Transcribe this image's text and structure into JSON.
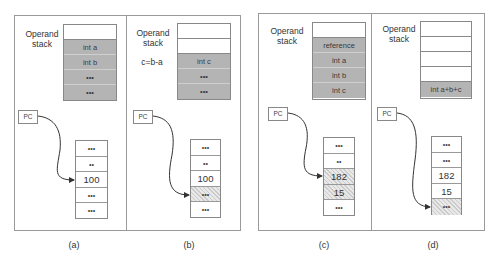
{
  "panels": [
    {
      "caption": "(a)",
      "stack_label": "Operand\nstack",
      "stack_label_line1": "Operand",
      "stack_label_line2": "stack",
      "note": "",
      "stack": [
        {
          "text": "",
          "state": "empty"
        },
        {
          "text": "int a",
          "state": "filled"
        },
        {
          "text": "int b",
          "state": "filled"
        },
        {
          "text": "•••",
          "state": "filled"
        },
        {
          "text": "•••",
          "state": "filled"
        }
      ],
      "pc_label": "PC",
      "memory": [
        {
          "text": "•••",
          "state": "normal"
        },
        {
          "text": "••",
          "state": "normal"
        },
        {
          "text": "100",
          "state": "normal"
        },
        {
          "text": "•••",
          "state": "normal"
        },
        {
          "text": "•••",
          "state": "normal"
        }
      ],
      "pc_points_to_index": 2
    },
    {
      "caption": "(b)",
      "stack_label_line1": "Operand",
      "stack_label_line2": "stack",
      "note": "c=b-a",
      "stack": [
        {
          "text": "",
          "state": "empty"
        },
        {
          "text": "",
          "state": "empty"
        },
        {
          "text": "int c",
          "state": "filled"
        },
        {
          "text": "•••",
          "state": "filled"
        },
        {
          "text": "•••",
          "state": "filled"
        }
      ],
      "pc_label": "PC",
      "memory": [
        {
          "text": "•••",
          "state": "normal"
        },
        {
          "text": "••",
          "state": "normal"
        },
        {
          "text": "100",
          "state": "normal"
        },
        {
          "text": "•••",
          "state": "highlighted"
        },
        {
          "text": "•••",
          "state": "normal"
        }
      ],
      "pc_points_to_index": 3
    },
    {
      "caption": "(c)",
      "stack_label_line1": "Operand",
      "stack_label_line2": "stack",
      "note": "",
      "stack": [
        {
          "text": "",
          "state": "empty"
        },
        {
          "text": "reference",
          "state": "filled"
        },
        {
          "text": "int a",
          "state": "filled"
        },
        {
          "text": "int b",
          "state": "filled"
        },
        {
          "text": "int c",
          "state": "filled"
        }
      ],
      "pc_label": "PC",
      "memory": [
        {
          "text": "•••",
          "state": "normal"
        },
        {
          "text": "••",
          "state": "normal"
        },
        {
          "text": "182",
          "state": "highlighted"
        },
        {
          "text": "15",
          "state": "highlighted"
        },
        {
          "text": "•••",
          "state": "normal"
        }
      ],
      "pc_points_to_index": 2
    },
    {
      "caption": "(d)",
      "stack_label_line1": "Operand",
      "stack_label_line2": "stack",
      "note": "",
      "stack": [
        {
          "text": "",
          "state": "empty"
        },
        {
          "text": "",
          "state": "empty"
        },
        {
          "text": "",
          "state": "empty"
        },
        {
          "text": "",
          "state": "empty"
        },
        {
          "text": "int a+b+c",
          "state": "filled"
        }
      ],
      "pc_label": "PC",
      "memory": [
        {
          "text": "•••",
          "state": "normal"
        },
        {
          "text": "•••",
          "state": "normal"
        },
        {
          "text": "182",
          "state": "normal"
        },
        {
          "text": "15",
          "state": "normal"
        },
        {
          "text": "•••",
          "state": "highlighted"
        }
      ],
      "pc_points_to_index": 4
    }
  ],
  "colors": {
    "stack_filled": "#b4b4b4",
    "frame_border": "#9a9a9a",
    "arrow": "#333333"
  }
}
